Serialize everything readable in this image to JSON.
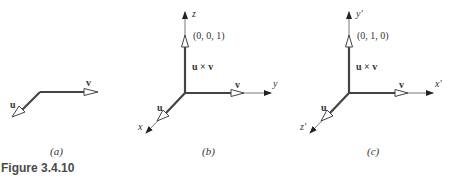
{
  "figure": {
    "caption": "Figure 3.4.10",
    "colors": {
      "thick_line": "#444444",
      "thin_line": "#555555",
      "text": "#333333",
      "caption": "#4a4a4a"
    }
  },
  "panels": [
    {
      "id": "a",
      "sublabel": "(a)",
      "vectors": [
        {
          "name": "u",
          "label": "u"
        },
        {
          "name": "v",
          "label": "v"
        }
      ]
    },
    {
      "id": "b",
      "sublabel": "(b)",
      "axes": {
        "x": "x",
        "y": "y",
        "z": "z"
      },
      "vectors": [
        {
          "name": "u",
          "label": "u"
        },
        {
          "name": "v",
          "label": "v"
        },
        {
          "name": "u_cross_v",
          "label": "u × v",
          "tip_coords": "(0, 0, 1)"
        }
      ]
    },
    {
      "id": "c",
      "sublabel": "(c)",
      "axes": {
        "x": "x′",
        "y": "y′",
        "z": "z′"
      },
      "vectors": [
        {
          "name": "u",
          "label": "u"
        },
        {
          "name": "v",
          "label": "v"
        },
        {
          "name": "u_cross_v",
          "label": "u × v",
          "tip_coords": "(0, 1, 0)"
        }
      ]
    }
  ]
}
